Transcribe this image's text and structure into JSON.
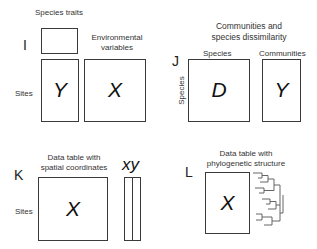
{
  "panels": {
    "I": {
      "letter": "I",
      "top_label": "Species traits",
      "env_label_line1": "Environmental",
      "env_label_line2": "variables",
      "row_label": "Sites",
      "matrix_left": "Y",
      "matrix_right": "X"
    },
    "J": {
      "letter": "J",
      "title_line1": "Communities and",
      "title_line2": "species dissimilarity",
      "col_label_left": "Species",
      "col_label_right": "Communities",
      "row_label": "Species",
      "matrix_left": "D",
      "matrix_right": "Y"
    },
    "K": {
      "letter": "K",
      "title_line1": "Data table with",
      "title_line2": "spatial coordinates",
      "row_label": "Sites",
      "matrix": "X",
      "coords_label": "xy"
    },
    "L": {
      "letter": "L",
      "title_line1": "Data table with",
      "title_line2": "phylogenetic structure",
      "matrix": "X",
      "tree_icon": "phylogenetic-tree"
    }
  },
  "colors": {
    "border": "#3a3a3a",
    "text": "#333333",
    "tree": "#555555"
  }
}
